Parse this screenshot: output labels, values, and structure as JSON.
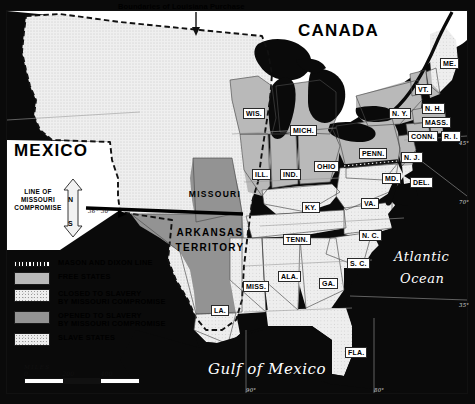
{
  "map": {
    "top_note": "Boundaries of Louisiana Purchase",
    "regions": {
      "mexico": "MEXICO",
      "canada": "CANADA",
      "missouri": "MISSOURI",
      "arkansas_territory_line1": "ARKANSAS",
      "arkansas_territory_line2": "TERRITORY",
      "atlantic_line1": "Atlantic",
      "atlantic_line2": "Ocean",
      "gulf": "Gulf of Mexico"
    },
    "compromise": {
      "line_label_1": "LINE OF",
      "line_label_2": "MISSOURI",
      "line_label_3": "COMPROMISE",
      "latitude": "36° 30'",
      "compass_north": "N",
      "compass_south": "S"
    },
    "states": [
      {
        "abbr": "WIS.",
        "x": 243,
        "y": 108
      },
      {
        "abbr": "MICH.",
        "x": 290,
        "y": 125
      },
      {
        "abbr": "N. Y.",
        "x": 389,
        "y": 108
      },
      {
        "abbr": "VT.",
        "x": 415,
        "y": 84
      },
      {
        "abbr": "ME.",
        "x": 440,
        "y": 58
      },
      {
        "abbr": "N. H.",
        "x": 422,
        "y": 103
      },
      {
        "abbr": "MASS.",
        "x": 422,
        "y": 117
      },
      {
        "abbr": "CONN.",
        "x": 408,
        "y": 131
      },
      {
        "abbr": "R. I.",
        "x": 441,
        "y": 131
      },
      {
        "abbr": "PENN.",
        "x": 359,
        "y": 148
      },
      {
        "abbr": "N. J.",
        "x": 401,
        "y": 152
      },
      {
        "abbr": "ILL.",
        "x": 252,
        "y": 169
      },
      {
        "abbr": "IND.",
        "x": 280,
        "y": 169
      },
      {
        "abbr": "OHIO",
        "x": 314,
        "y": 161
      },
      {
        "abbr": "MD.",
        "x": 382,
        "y": 173
      },
      {
        "abbr": "DEL.",
        "x": 410,
        "y": 177
      },
      {
        "abbr": "KY.",
        "x": 302,
        "y": 202
      },
      {
        "abbr": "VA.",
        "x": 361,
        "y": 198
      },
      {
        "abbr": "TENN.",
        "x": 283,
        "y": 234
      },
      {
        "abbr": "N. C.",
        "x": 359,
        "y": 230
      },
      {
        "abbr": "S. C.",
        "x": 347,
        "y": 258
      },
      {
        "abbr": "MISS.",
        "x": 243,
        "y": 281
      },
      {
        "abbr": "ALA.",
        "x": 278,
        "y": 271
      },
      {
        "abbr": "GA.",
        "x": 319,
        "y": 278
      },
      {
        "abbr": "LA.",
        "x": 211,
        "y": 305
      },
      {
        "abbr": "FLA.",
        "x": 345,
        "y": 347
      }
    ],
    "coordinates": [
      {
        "label": "45°",
        "x": 459,
        "y": 140
      },
      {
        "label": "70°",
        "x": 459,
        "y": 199
      },
      {
        "label": "35°",
        "x": 459,
        "y": 302
      },
      {
        "label": "90°",
        "x": 246,
        "y": 387
      },
      {
        "label": "80°",
        "x": 374,
        "y": 387
      }
    ]
  },
  "legend": {
    "items": [
      {
        "swatch": "mason-dixon-dashes",
        "line1": "MASON AND DIXON LINE",
        "line2": ""
      },
      {
        "swatch": "free",
        "line1": "FREE STATES",
        "line2": ""
      },
      {
        "swatch": "closed",
        "line1": "CLOSED TO SLAVERY",
        "line2": "BY MISSOURI COMPROMISE"
      },
      {
        "swatch": "opened",
        "line1": "OPENED TO SLAVERY",
        "line2": "BY MISSOURI COMPROMISE"
      },
      {
        "swatch": "slave",
        "line1": "SLAVE STATES",
        "line2": ""
      }
    ]
  },
  "scale": {
    "unit": "MILES",
    "ticks": [
      "0",
      "200",
      "400"
    ]
  },
  "colors": {
    "free_states": "#b9b9b9",
    "opened_to_slavery": "#939393",
    "slave_states": "#ededed",
    "closed_to_slavery": "#efefef",
    "ocean": "#0a0a0a",
    "lakes": "#0a0a0a"
  }
}
